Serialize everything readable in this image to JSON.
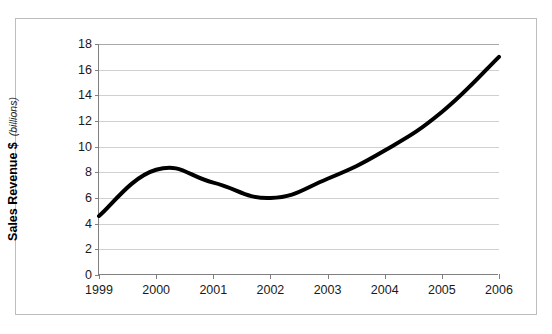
{
  "chart_data": {
    "type": "line",
    "title": "",
    "xlabel": "",
    "ylabel": "Sales Revenue $",
    "ylabel_sub": "(billions)",
    "categories": [
      "1999",
      "2000",
      "2001",
      "2002",
      "2003",
      "2004",
      "2005",
      "2006"
    ],
    "values": [
      4.6,
      8.2,
      7.2,
      6.0,
      7.5,
      9.7,
      12.7,
      17.0
    ],
    "series": [
      {
        "name": "Sales Revenue",
        "values": [
          4.6,
          8.2,
          7.2,
          6.0,
          7.5,
          9.7,
          12.7,
          17.0
        ],
        "color": "#000000",
        "line_width": 4,
        "smoothed": true,
        "markers": false
      }
    ],
    "ylim": [
      0,
      18
    ],
    "ytick_values": [
      0,
      2,
      4,
      6,
      8,
      10,
      12,
      14,
      16,
      18
    ],
    "ytick_labels": [
      "0",
      "2",
      "4",
      "6",
      "8",
      "10",
      "12",
      "14",
      "16",
      "18"
    ],
    "grid": "horizontal",
    "grid_color": "#d0d0d0",
    "legend": "none",
    "plot_background": "#ffffff",
    "axis_color": "#808080",
    "border_color": "#bdbdbd"
  }
}
